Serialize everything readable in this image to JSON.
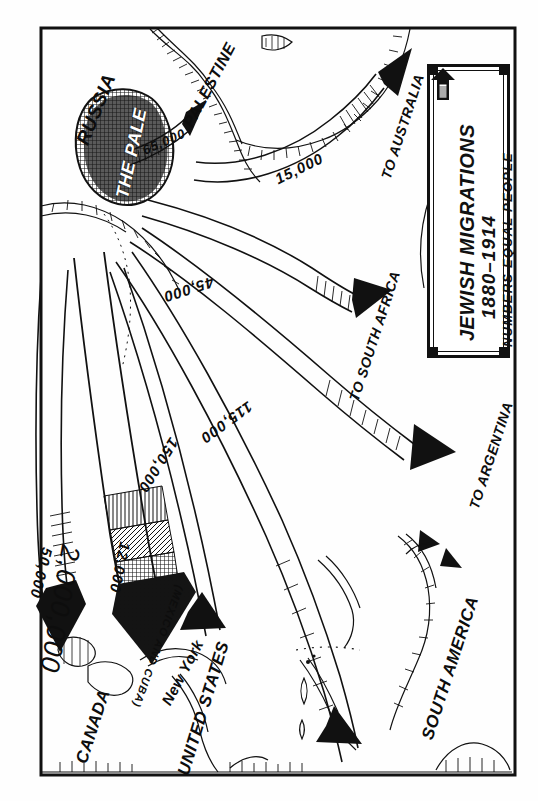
{
  "map": {
    "kind": "hand-drawn historical migration map",
    "orientation_note": "all text rendered rotated 90 degrees (reads bottom-to-top)",
    "border": {
      "color": "#111111"
    },
    "title_block": {
      "line1": "JEWISH MIGRATIONS",
      "line2": "1880–1914",
      "line3": "NUMBERS EQUAL PEOPLE",
      "key_icon": "up-arrow-scale-icon"
    },
    "place_labels": [
      {
        "id": "russia",
        "text": "RUSSIA"
      },
      {
        "id": "the-pale",
        "text": "THE PALE"
      },
      {
        "id": "palestine",
        "text": "PALESTINE"
      },
      {
        "id": "canada",
        "text": "CANADA"
      },
      {
        "id": "united-states",
        "text": "UNITED STATES"
      },
      {
        "id": "new-york",
        "text": "New York"
      },
      {
        "id": "south-america",
        "text": "SOUTH AMERICA"
      }
    ],
    "destination_labels": [
      {
        "id": "australia",
        "text": "TO AUSTRALIA"
      },
      {
        "id": "south-africa",
        "text": "TO SOUTH AFRICA"
      },
      {
        "id": "argentina",
        "text": "TO ARGENTINA"
      }
    ],
    "flows": [
      {
        "id": "palestine",
        "value": "65,000",
        "destination": "PALESTINE"
      },
      {
        "id": "australia",
        "value": "15,000",
        "destination": "TO AUSTRALIA"
      },
      {
        "id": "south-africa",
        "value": "45,000",
        "destination": "TO SOUTH AFRICA"
      },
      {
        "id": "argentina",
        "value": "115,000",
        "destination": "TO ARGENTINA"
      },
      {
        "id": "south-america",
        "value": "150,000",
        "destination": "SOUTH AMERICA"
      },
      {
        "id": "canada",
        "value": "50,000",
        "destination": "CANADA"
      },
      {
        "id": "united-states",
        "value": "2,000,000",
        "destination": "UNITED STATES"
      },
      {
        "id": "mexico-cuba",
        "value": "12,000",
        "destination": "(MEXICO AND CUBA)"
      }
    ],
    "annotations": [
      {
        "id": "mexico-cuba-note",
        "text": "(MEXICO AND CUBA)"
      }
    ]
  }
}
